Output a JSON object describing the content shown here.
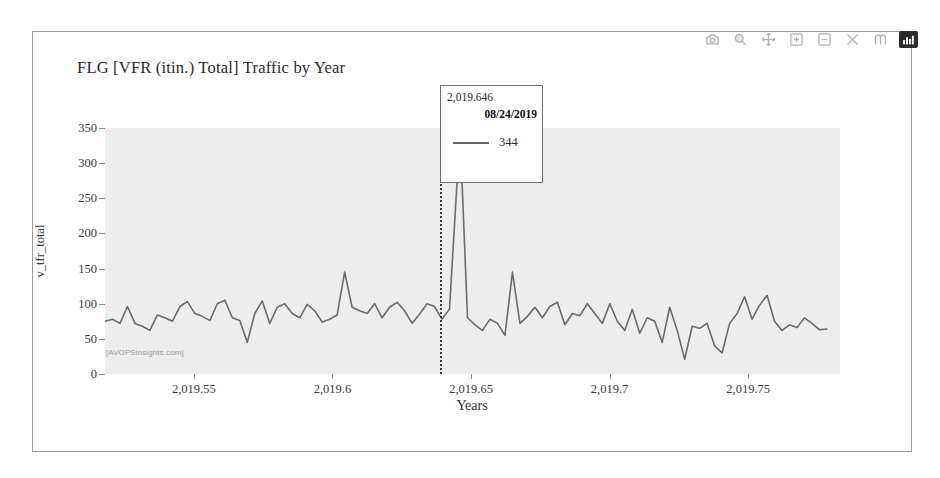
{
  "modebar": {
    "buttons": [
      {
        "name": "download-plot-icon",
        "label": "Download plot as a png"
      },
      {
        "name": "zoom-icon",
        "label": "Zoom"
      },
      {
        "name": "pan-icon",
        "label": "Pan"
      },
      {
        "name": "zoom-in-icon",
        "label": "Zoom in"
      },
      {
        "name": "zoom-out-icon",
        "label": "Zoom out"
      },
      {
        "name": "autoscale-icon",
        "label": "Autoscale"
      },
      {
        "name": "reset-axes-icon",
        "label": "Reset axes"
      },
      {
        "name": "plotly-logo-icon",
        "label": "Produced with Plotly"
      }
    ]
  },
  "tooltip": {
    "x_value": "2,019.646",
    "date": "08/24/2019",
    "value": "344"
  },
  "watermark": "[AVOPSinsights.com]",
  "colors": {
    "line": "#6b6b6b",
    "plot_background": "#ededed",
    "frame_border": "#9a9a9a",
    "axis_text": "#3a3a3a",
    "logo_button": "#2b2b2b"
  },
  "chart_data": {
    "type": "line",
    "title": "FLG [VFR (itin.) Total] Traffic by Year",
    "xlabel": "Years",
    "ylabel": "v_tfr_total",
    "xlim": [
      2019.518,
      2019.783
    ],
    "ylim": [
      0,
      350
    ],
    "grid": false,
    "legend": "none",
    "yticks": [
      0,
      50,
      100,
      150,
      200,
      250,
      300,
      350
    ],
    "xticks": [
      2019.55,
      2019.6,
      2019.65,
      2019.7,
      2019.75
    ],
    "xtick_labels": [
      "2,019.55",
      "2,019.6",
      "2,019.65",
      "2,019.7",
      "2,019.75"
    ],
    "ytick_labels": [
      "0",
      "50",
      "100",
      "150",
      "200",
      "250",
      "300",
      "350"
    ],
    "annotation": {
      "hover_x": 2019.646,
      "hover_date": "08/24/2019",
      "hover_y": 344
    },
    "series": [
      {
        "name": "v_tfr_total",
        "x": [
          2019.518,
          2019.5207,
          2019.5234,
          2019.5261,
          2019.5288,
          2019.5315,
          2019.5342,
          2019.5369,
          2019.5396,
          2019.5423,
          2019.545,
          2019.5477,
          2019.5504,
          2019.5531,
          2019.5558,
          2019.5585,
          2019.5612,
          2019.5639,
          2019.5666,
          2019.5693,
          2019.572,
          2019.5747,
          2019.5774,
          2019.5801,
          2019.5828,
          2019.5855,
          2019.5882,
          2019.5909,
          2019.5936,
          2019.5963,
          2019.599,
          2019.6017,
          2019.6044,
          2019.6071,
          2019.6098,
          2019.6125,
          2019.6152,
          2019.6179,
          2019.6206,
          2019.6233,
          2019.626,
          2019.6287,
          2019.6314,
          2019.6341,
          2019.6368,
          2019.6395,
          2019.6422,
          2019.646,
          2019.6487,
          2019.6514,
          2019.6541,
          2019.6568,
          2019.6595,
          2019.6622,
          2019.6649,
          2019.6676,
          2019.6703,
          2019.673,
          2019.6757,
          2019.6784,
          2019.6811,
          2019.6838,
          2019.6865,
          2019.6892,
          2019.6919,
          2019.6946,
          2019.6973,
          2019.7,
          2019.7027,
          2019.7054,
          2019.7081,
          2019.7108,
          2019.7135,
          2019.7162,
          2019.7189,
          2019.7216,
          2019.7243,
          2019.727,
          2019.7297,
          2019.7324,
          2019.7351,
          2019.7378,
          2019.7405,
          2019.7432,
          2019.7459,
          2019.7486,
          2019.7513,
          2019.754,
          2019.7567,
          2019.7594,
          2019.7621,
          2019.7648,
          2019.7675,
          2019.7702,
          2019.7729,
          2019.7756,
          2019.7783
        ],
        "y": [
          75,
          78,
          72,
          96,
          72,
          68,
          62,
          84,
          80,
          75,
          96,
          103,
          86,
          82,
          76,
          100,
          105,
          80,
          76,
          45,
          86,
          104,
          72,
          95,
          100,
          86,
          80,
          99,
          90,
          74,
          78,
          84,
          145,
          95,
          90,
          86,
          100,
          80,
          95,
          102,
          90,
          72,
          85,
          100,
          96,
          78,
          92,
          344,
          80,
          70,
          62,
          78,
          72,
          55,
          145,
          72,
          82,
          95,
          80,
          96,
          102,
          70,
          86,
          83,
          100,
          86,
          72,
          100,
          75,
          62,
          92,
          58,
          80,
          75,
          45,
          95,
          62,
          21,
          68,
          65,
          72,
          40,
          30,
          72,
          86,
          110,
          78,
          98,
          112,
          75,
          62,
          70,
          66,
          80,
          72,
          63,
          64
        ]
      }
    ]
  }
}
